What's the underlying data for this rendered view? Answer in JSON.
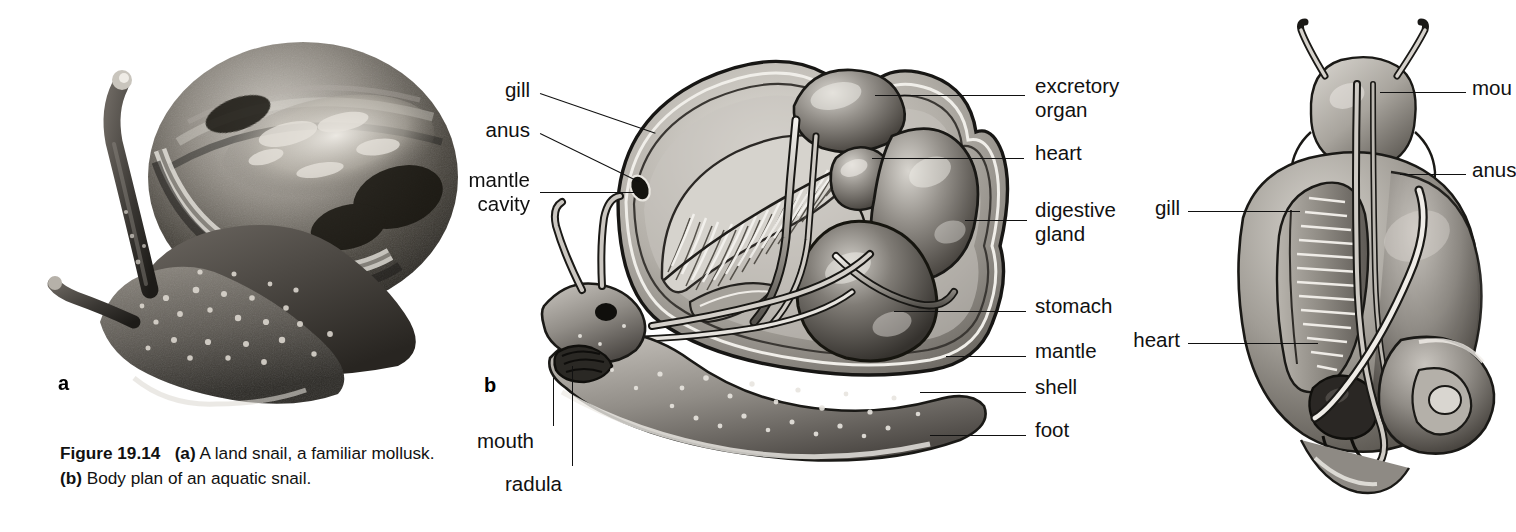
{
  "figure": {
    "number": "Figure 19.14",
    "caption_part_a": "(a)",
    "caption_text_a": " A land snail, a familiar mollusk. ",
    "caption_part_b": "(b)",
    "caption_text_b": " Body plan of an aquatic snail.",
    "background_color": "#ffffff",
    "line_color": "#111111"
  },
  "panels": {
    "a": {
      "marker": "a",
      "subject": "land snail photograph",
      "type": "grayscale-photograph"
    },
    "b": {
      "marker": "b",
      "subject": "aquatic snail body plan, sagittal section",
      "type": "line-and-tone-illustration"
    },
    "c": {
      "marker": "",
      "subject": "aquatic snail dorsal view, clipped at right edge",
      "type": "line-and-tone-illustration"
    }
  },
  "labels_b_left": [
    {
      "id": "gill",
      "text": "gill"
    },
    {
      "id": "anus",
      "text": "anus"
    },
    {
      "id": "mantle-cavity",
      "line1": "mantle",
      "line2": "cavity"
    }
  ],
  "labels_b_right": [
    {
      "id": "excretory-organ",
      "line1": "excretory",
      "line2": "organ"
    },
    {
      "id": "heart",
      "text": "heart"
    },
    {
      "id": "digestive-gland",
      "line1": "digestive",
      "line2": "gland"
    },
    {
      "id": "stomach",
      "text": "stomach"
    },
    {
      "id": "mantle",
      "text": "mantle"
    },
    {
      "id": "shell",
      "text": "shell"
    },
    {
      "id": "foot",
      "text": "foot"
    }
  ],
  "labels_b_bottom": [
    {
      "id": "mouth",
      "text": "mouth"
    },
    {
      "id": "radula",
      "text": "radula"
    }
  ],
  "labels_c": [
    {
      "id": "mouth",
      "text": "mou",
      "full": "mouth",
      "clipped": true
    },
    {
      "id": "anus",
      "text": "anus",
      "full": "anus",
      "clipped": true
    },
    {
      "id": "gill",
      "text": "gill",
      "clipped": false
    },
    {
      "id": "heart",
      "text": "heart",
      "clipped": false
    }
  ]
}
